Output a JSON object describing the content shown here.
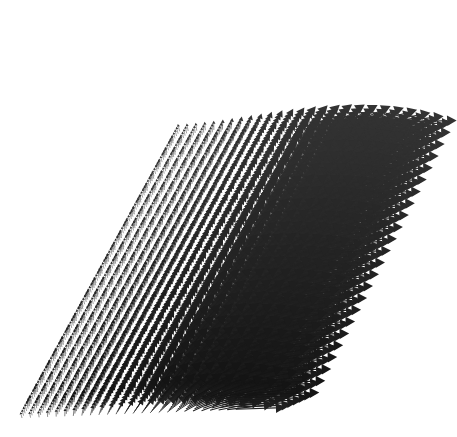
{
  "figure": {
    "type": "quiver-3d",
    "title": "",
    "background_color": "#ffffff",
    "width": 457,
    "height": 437
  },
  "chart_data": {
    "type": "scatter",
    "plot_kind": "quiver-3d-vector-field",
    "title": "",
    "subtitle": "",
    "xlabel": "",
    "ylabel": "",
    "zlabel": "",
    "legend": [],
    "annotations": [],
    "grid": false,
    "axes_visible": false,
    "ticks_visible": false,
    "tick_labels": [],
    "xlim": [
      0,
      1
    ],
    "ylim": [
      0,
      1
    ],
    "zlim": [
      0,
      1
    ],
    "arrow_color": "#1a1a1a",
    "arrow_color_light": "#4d4d4d",
    "grid_dims": {
      "nx": 26,
      "ny": 24,
      "nz": 7
    },
    "projection": {
      "origin_x": 22,
      "origin_y": 418,
      "ax_x": 8.55,
      "ax_y": -0.35,
      "ay_x": 6.45,
      "ay_y": -11.85,
      "az_x": 1.55,
      "az_y": -2.35
    },
    "vector_field": {
      "description": "Arrow direction rotates smoothly with x from up-left through vertical to horizontal-right; magnitude grows with x and with z height.",
      "angle_start_deg": -104,
      "angle_end_deg": -2,
      "length_min": 5.5,
      "length_max": 46.0,
      "length_gain_z": 0.55,
      "head_ratio": 0.34,
      "shaft_width_min": 0.45,
      "shaft_width_max": 1.25
    }
  }
}
